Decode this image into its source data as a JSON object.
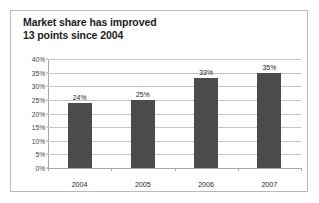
{
  "figure": {
    "border_color": "#b9b9b9",
    "background": "#ffffff"
  },
  "title": {
    "line1": "Market share has improved",
    "line2": "13 points since 2004"
  },
  "chart_data": {
    "type": "bar",
    "title": "Market share has improved 13 points since 2004",
    "xlabel": "",
    "ylabel": "",
    "categories": [
      "2004",
      "2005",
      "2006",
      "2007"
    ],
    "values": [
      24,
      25,
      33,
      35
    ],
    "data_labels": [
      "24%",
      "25%",
      "33%",
      "35%"
    ],
    "ylim": [
      0,
      40
    ],
    "ytick_values": [
      0,
      5,
      10,
      15,
      20,
      25,
      30,
      35,
      40
    ],
    "ytick_labels": [
      "0%",
      "5%",
      "10%",
      "15%",
      "20%",
      "25%",
      "30%",
      "35%",
      "40%"
    ],
    "grid": true,
    "grid_axis": "y",
    "legend": false,
    "legend_position": "none",
    "bar_color": "#4b4b4b",
    "gridline_color": "#c5c5c5",
    "axis_color": "#a8a8a8",
    "units": "percent"
  }
}
